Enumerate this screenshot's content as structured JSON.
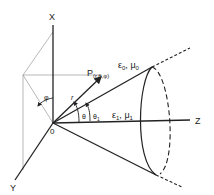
{
  "diagram": {
    "axes": {
      "x_label": "X",
      "y_label": "Y",
      "z_label": "Z",
      "origin_label": "0"
    },
    "point": {
      "label": "P",
      "subscript": "(r,θ,φ)"
    },
    "radius_label": "r",
    "angles": {
      "theta": "θ",
      "theta1": "θ",
      "theta1_sub": "1",
      "phi": "φ"
    },
    "region_outer": {
      "eps": "ε",
      "eps_sub": "0",
      "sep": ", ",
      "mu": "μ",
      "mu_sub": "0"
    },
    "region_inner": {
      "eps": "ε",
      "eps_sub": "1",
      "sep": ", ",
      "mu": "μ",
      "mu_sub": "1"
    },
    "colors": {
      "line": "#222222",
      "construction": "#999999"
    }
  }
}
